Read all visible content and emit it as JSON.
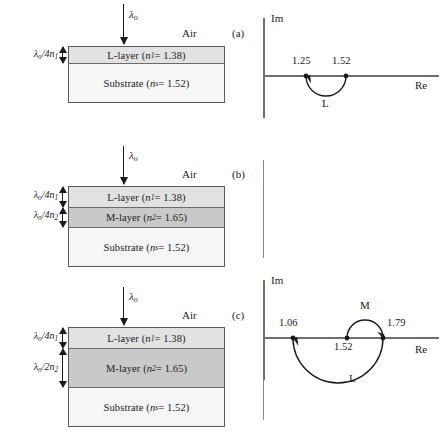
{
  "figure": {
    "lambda_symbol": "λ",
    "air_label": "Air",
    "axis_im": "Im",
    "axis_re": "Re"
  },
  "panels": [
    {
      "letter": "(a)",
      "incident_label": "λo",
      "air_label": "Air",
      "layers": [
        {
          "name": "l-layer",
          "label": "L-layer (n1 = 1.38)",
          "fill": "#e2e2e2"
        },
        {
          "name": "substrate",
          "label": "Substrate (ns = 1.52)",
          "fill": "#f6f6f6"
        }
      ],
      "thickness_labels": [
        "λo/4n1"
      ],
      "plot": {
        "axis_im": "Im",
        "axis_re": "Re",
        "ticks": [
          {
            "value": "1.25",
            "x": 1.25
          },
          {
            "value": "1.52",
            "x": 1.52
          }
        ],
        "curves": [
          {
            "label": "L",
            "from": 1.52,
            "to": 1.25,
            "half": "lower",
            "turns": 0.5,
            "arrow_at": 1.25
          }
        ]
      }
    },
    {
      "letter": "(b)",
      "incident_label": "λo",
      "air_label": "Air",
      "layers": [
        {
          "name": "l-layer",
          "label": "L-layer (n1 = 1.38)",
          "fill": "#e2e2e2"
        },
        {
          "name": "m-layer",
          "label": "M-layer (n2 = 1.65)",
          "fill": "#c9c9c9"
        },
        {
          "name": "substrate",
          "label": "Substrate (ns = 1.52)",
          "fill": "#f6f6f6"
        }
      ],
      "thickness_labels": [
        "λo/4n1",
        "λo/4n2"
      ],
      "plot": {
        "axis_im": "Im",
        "axis_re": "Re",
        "ticks": [
          {
            "value": "1.06",
            "x": 1.06
          },
          {
            "value": "1.52",
            "x": 1.52
          },
          {
            "value": "1.79",
            "x": 1.79
          }
        ],
        "curves": [
          {
            "label": "M",
            "from": 1.52,
            "to": 1.79,
            "half": "upper",
            "turns": 0.5,
            "arrow_at": 1.79
          },
          {
            "label": "L",
            "from": 1.79,
            "to": 1.06,
            "half": "lower",
            "turns": 0.5,
            "arrow_at": 1.06
          }
        ]
      }
    },
    {
      "letter": "(c)",
      "incident_label": "λo",
      "air_label": "Air",
      "layers": [
        {
          "name": "l-layer",
          "label": "L-layer (n1 = 1.38)",
          "fill": "#e2e2e2"
        },
        {
          "name": "m-layer",
          "label": "M-layer (n2 = 1.65)",
          "fill": "#c9c9c9"
        },
        {
          "name": "substrate",
          "label": "Substrate (ns = 1.52)",
          "fill": "#f6f6f6"
        }
      ],
      "thickness_labels": [
        "λo/4n1",
        "λo/2n2"
      ],
      "plot": {
        "axis_im": "Im",
        "axis_re": "Re",
        "ticks": [
          {
            "value": "1.25",
            "x": 1.25
          },
          {
            "value": "1.52",
            "x": 1.52
          }
        ],
        "curves": [
          {
            "label": "M",
            "from": 1.52,
            "to": 1.52,
            "half": "full",
            "turns": 1.0,
            "arrow_at": 1.52
          },
          {
            "label": "L",
            "from": 1.52,
            "to": 1.25,
            "half": "lower",
            "turns": 0.5,
            "arrow_at": 1.25
          }
        ]
      }
    }
  ],
  "chart_data": {
    "type": "diagram",
    "substrate_index": 1.52,
    "air_index": 1.0,
    "stacks": [
      {
        "panel": "(a)",
        "films": [
          {
            "layer": "L",
            "index": 1.38,
            "optical_thickness": "quarter-wave (λo/4n1)"
          }
        ],
        "substrate": {
          "index": 1.52
        },
        "locus_points": [
          1.52,
          1.25
        ],
        "final_admittance": 1.25
      },
      {
        "panel": "(b)",
        "films": [
          {
            "layer": "L",
            "index": 1.38,
            "optical_thickness": "quarter-wave (λo/4n1)"
          },
          {
            "layer": "M",
            "index": 1.65,
            "optical_thickness": "quarter-wave (λo/4n2)"
          }
        ],
        "substrate": {
          "index": 1.52
        },
        "locus_points": [
          1.52,
          1.79,
          1.06
        ],
        "final_admittance": 1.06
      },
      {
        "panel": "(c)",
        "films": [
          {
            "layer": "L",
            "index": 1.38,
            "optical_thickness": "quarter-wave (λo/4n1)"
          },
          {
            "layer": "M",
            "index": 1.65,
            "optical_thickness": "half-wave (λo/2n2)"
          }
        ],
        "substrate": {
          "index": 1.52
        },
        "locus_points": [
          1.52,
          1.52,
          1.25
        ],
        "final_admittance": 1.25
      }
    ],
    "xlabel": "Re",
    "ylabel": "Im"
  }
}
